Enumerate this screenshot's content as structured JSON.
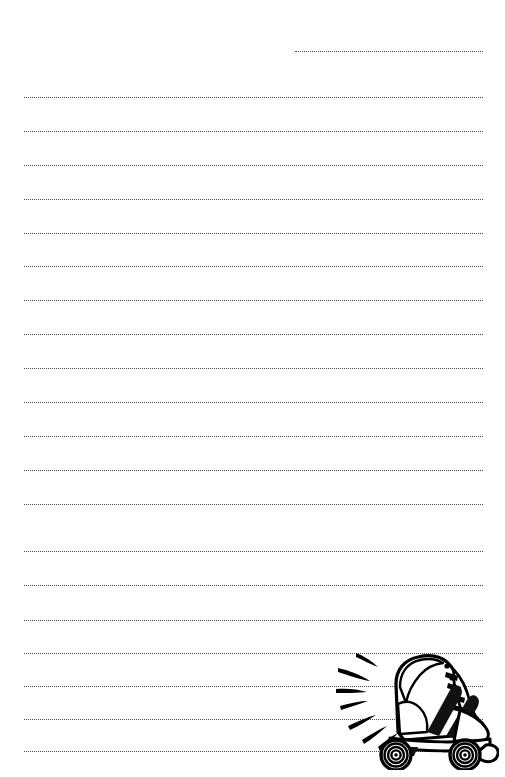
{
  "document": {
    "type": "lined-writing-paper",
    "title": "Lined Writing Paper with Roller Skate",
    "background_color": "#ffffff",
    "ink_color": "#2b2b2b",
    "width": 505,
    "height": 777
  },
  "rules": {
    "style": "dotted",
    "stroke_color": "#2b2b2b",
    "thickness_px": 1.6,
    "default_left_px": 24,
    "default_right_px": 483,
    "spacing_px": 34,
    "count": 21,
    "lines": [
      {
        "index": 1,
        "y": 51,
        "left": 295,
        "right": 483,
        "partial": true
      },
      {
        "index": 2,
        "y": 97,
        "left": 24,
        "right": 483,
        "partial": false
      },
      {
        "index": 3,
        "y": 131,
        "left": 24,
        "right": 483,
        "partial": false
      },
      {
        "index": 4,
        "y": 165,
        "left": 24,
        "right": 483,
        "partial": false
      },
      {
        "index": 5,
        "y": 199,
        "left": 24,
        "right": 483,
        "partial": false
      },
      {
        "index": 6,
        "y": 233,
        "left": 24,
        "right": 483,
        "partial": false
      },
      {
        "index": 7,
        "y": 266,
        "left": 24,
        "right": 483,
        "partial": false
      },
      {
        "index": 8,
        "y": 300,
        "left": 24,
        "right": 483,
        "partial": false
      },
      {
        "index": 9,
        "y": 334,
        "left": 24,
        "right": 483,
        "partial": false
      },
      {
        "index": 10,
        "y": 368,
        "left": 24,
        "right": 483,
        "partial": false
      },
      {
        "index": 11,
        "y": 402,
        "left": 24,
        "right": 483,
        "partial": false
      },
      {
        "index": 12,
        "y": 436,
        "left": 24,
        "right": 483,
        "partial": false
      },
      {
        "index": 13,
        "y": 470,
        "left": 24,
        "right": 483,
        "partial": false
      },
      {
        "index": 14,
        "y": 504,
        "left": 24,
        "right": 483,
        "partial": false
      },
      {
        "index": 15,
        "y": 551,
        "left": 24,
        "right": 483,
        "partial": false
      },
      {
        "index": 16,
        "y": 585,
        "left": 24,
        "right": 483,
        "partial": false
      },
      {
        "index": 17,
        "y": 620,
        "left": 24,
        "right": 483,
        "partial": false
      },
      {
        "index": 18,
        "y": 653,
        "left": 24,
        "right": 483,
        "partial": false
      },
      {
        "index": 19,
        "y": 686,
        "left": 24,
        "right": 483,
        "partial": false
      },
      {
        "index": 20,
        "y": 719,
        "left": 24,
        "right": 483,
        "partial": false
      },
      {
        "index": 21,
        "y": 751,
        "left": 24,
        "right": 483,
        "partial": false
      }
    ]
  },
  "illustration": {
    "name": "roller-skate",
    "description": "Black and white line-art roller skate with high-top boot, laces, two dark diagonal stripes, four wheels, toe stop, and motion speed lines",
    "position": {
      "left": 334,
      "top": 640,
      "width": 165,
      "height": 130
    },
    "fill_color": "#ffffff",
    "stroke_color": "#000000",
    "accent_color": "#1a1a1a",
    "parts": [
      "speed-lines",
      "boot-upper",
      "boot-collar",
      "lace-eyelets",
      "laces",
      "stripes",
      "sole-plate",
      "wheel-front",
      "wheel-rear",
      "toe-stop"
    ],
    "speed_line_count": 7,
    "wheel_ring_count": 4
  }
}
